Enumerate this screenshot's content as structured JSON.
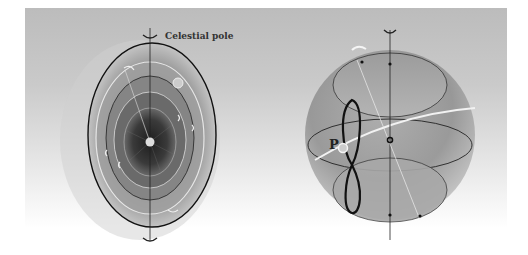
{
  "figure": {
    "left_panel": {
      "name": "precession-rings",
      "label": "Celestial pole",
      "icons": [
        "rotation-arrow-top",
        "rotation-arrow-bottom"
      ]
    },
    "right_panel": {
      "name": "celestial-sphere",
      "point_label": "P",
      "icons": [
        "rotation-arrow-top",
        "rotation-arrow-tilted"
      ]
    },
    "colors": {
      "background_top": "#bcbcbc",
      "background_bottom": "#ffffff",
      "outline": "#111111",
      "highlight": "#f2f2f2"
    }
  }
}
